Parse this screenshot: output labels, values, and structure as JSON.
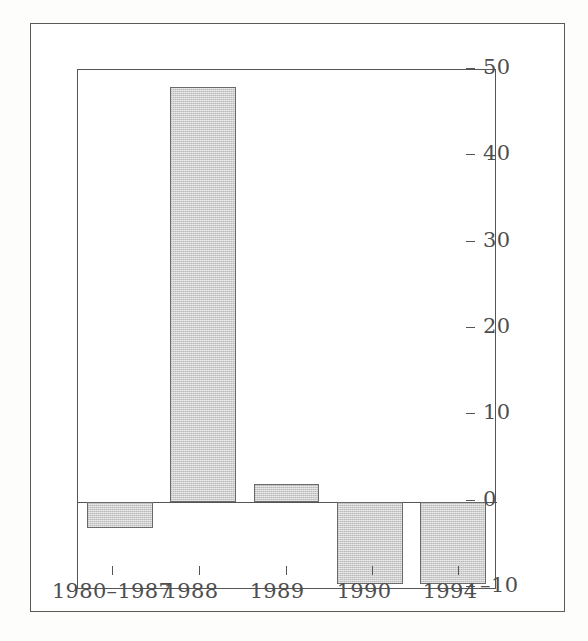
{
  "chart_data": {
    "type": "bar",
    "title": "",
    "subtitle": "",
    "xlabel": "",
    "ylabel": "",
    "categories": [
      "1980–1987",
      "1988",
      "1989",
      "1990",
      "1994"
    ],
    "values": [
      -3,
      48,
      2,
      -9.5,
      -9.5
    ],
    "series": [
      {
        "name": "value",
        "values": [
          -3,
          48,
          2,
          -9.5,
          -9.5
        ]
      }
    ],
    "ylim": [
      -10,
      50
    ],
    "yticks": [
      -10,
      0,
      10,
      20,
      30,
      40,
      50
    ],
    "ytick_labels": [
      "–10",
      "0",
      "10",
      "20",
      "30",
      "40",
      "50"
    ],
    "xtick_positions": [
      1,
      2,
      3,
      4,
      5
    ],
    "y_axis_position": "right",
    "grid": false,
    "legend": "none",
    "bar_fill_color": "#cdcdcd",
    "bar_edge_color": "#6a6a6a",
    "axis_color": "#555555",
    "background_color": "#ffffff"
  },
  "axes": {
    "y": {
      "ticks": [
        {
          "value": 50,
          "label": "50"
        },
        {
          "value": 40,
          "label": "40"
        },
        {
          "value": 30,
          "label": "30"
        },
        {
          "value": 20,
          "label": "20"
        },
        {
          "value": 10,
          "label": "10"
        },
        {
          "value": 0,
          "label": "0"
        },
        {
          "value": -10,
          "label": "–10"
        }
      ]
    },
    "x": {
      "ticks": [
        {
          "label": "1980–1987"
        },
        {
          "label": "1988"
        },
        {
          "label": "1989"
        },
        {
          "label": "1990"
        },
        {
          "label": "1994"
        }
      ]
    }
  },
  "bars": [
    {
      "category": "1980–1987",
      "value": -3
    },
    {
      "category": "1988",
      "value": 48
    },
    {
      "category": "1989",
      "value": 2
    },
    {
      "category": "1990",
      "value": -9.5
    },
    {
      "category": "1994",
      "value": -9.5
    }
  ]
}
